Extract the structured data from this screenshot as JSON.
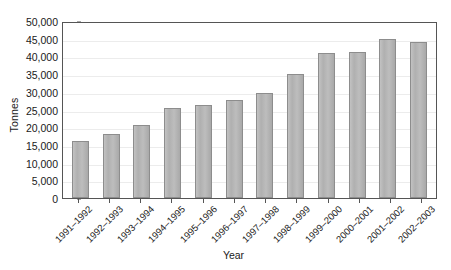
{
  "chart_data": {
    "type": "bar",
    "title": "",
    "xlabel": "Year",
    "ylabel": "Tonnes",
    "categories": [
      "1991–1992",
      "1992–1993",
      "1993–1994",
      "1994–1995",
      "1995–1996",
      "1996–1997",
      "1997–1998",
      "1998–1999",
      "1999–2000",
      "2000–2001",
      "2001–2002",
      "2002–2003"
    ],
    "values": [
      16100,
      18000,
      20700,
      25500,
      26300,
      27600,
      29600,
      35000,
      41000,
      41200,
      45000,
      44000
    ],
    "ylim": [
      0,
      50000
    ],
    "ytick_step": 5000,
    "ytick_labels": [
      "0",
      "5,000",
      "10,000",
      "15,000",
      "20,000",
      "25,000",
      "30,000",
      "35,000",
      "40,000",
      "45,000",
      "50,000"
    ],
    "ytick_values": [
      0,
      5000,
      10000,
      15000,
      20000,
      25000,
      30000,
      35000,
      40000,
      45000,
      50000
    ],
    "grid": true,
    "legend": false,
    "bar_color": "#b4b4b4",
    "bar_border_color": "#8d8d8d",
    "gridline_color": "#ececec",
    "axis_color": "#555555"
  }
}
